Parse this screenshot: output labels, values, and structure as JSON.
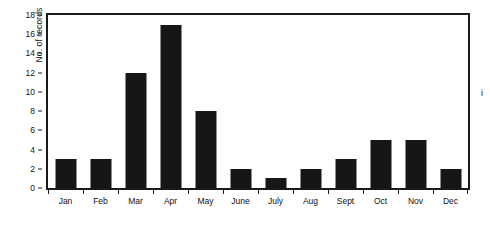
{
  "chart_data": {
    "type": "bar",
    "title": "",
    "xlabel": "",
    "ylabel": "No. of records",
    "categories": [
      "Jan",
      "Feb",
      "Mar",
      "Apr",
      "May",
      "June",
      "July",
      "Aug",
      "Sept",
      "Oct",
      "Nov",
      "Dec"
    ],
    "values": [
      3,
      3,
      12,
      17,
      8,
      2,
      1,
      2,
      3,
      5,
      5,
      2
    ],
    "ylim": [
      0,
      18
    ],
    "ytick_step": 2,
    "yticks": [
      0,
      2,
      4,
      6,
      8,
      10,
      12,
      14,
      16,
      18
    ],
    "ytick_labels": [
      "0",
      "2",
      "4",
      "6",
      "8",
      "10",
      "12",
      "14",
      "16",
      "18"
    ],
    "grid": false,
    "legend": null,
    "bar_color": "#161616",
    "frame_color": "#1a1a1a",
    "background_color": "#ffffff"
  },
  "annotations": {
    "edge_fragment": "i"
  }
}
